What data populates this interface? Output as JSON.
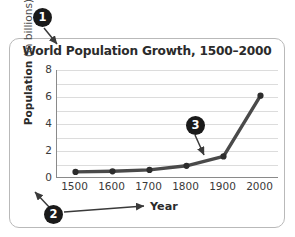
{
  "chart_data": {
    "type": "line",
    "title": "World Population Growth, 1500–2000",
    "xlabel": "Year",
    "ylabel_bold": "Population",
    "ylabel_light": "(in billions)",
    "categories": [
      "1500",
      "1600",
      "1700",
      "1800",
      "1900",
      "2000"
    ],
    "x": [
      1500,
      1600,
      1700,
      1800,
      1900,
      2000
    ],
    "values": [
      0.45,
      0.5,
      0.6,
      0.9,
      1.6,
      6.1
    ],
    "series": [
      {
        "name": "World population",
        "values": [
          0.45,
          0.5,
          0.6,
          0.9,
          1.6,
          6.1
        ]
      }
    ],
    "xlim": [
      1450,
      2050
    ],
    "ylim": [
      0,
      8
    ],
    "yticks": [
      "8",
      "6",
      "4",
      "2",
      "0"
    ],
    "ytick_values": [
      8,
      6,
      4,
      2,
      0
    ],
    "gridlines": [
      1,
      2,
      3,
      4,
      5,
      6,
      7,
      8
    ],
    "grid": true,
    "legend": "none",
    "line_color": "#4a4a4a",
    "marker_color": "#2d2d2d",
    "grid_color": "#dcdcdc",
    "axis_color": "#8a8a8a"
  },
  "callouts": [
    {
      "id": "1",
      "label": "1",
      "target": "chart-title"
    },
    {
      "id": "2",
      "label": "2",
      "target": "axis-labels"
    },
    {
      "id": "3",
      "label": "3",
      "target": "data-point-1900"
    }
  ],
  "colors": {
    "frame": "#b9b9b9",
    "text": "#2b2b2b",
    "callout_bg": "#1a1a1a",
    "callout_fg": "#ffffff"
  }
}
